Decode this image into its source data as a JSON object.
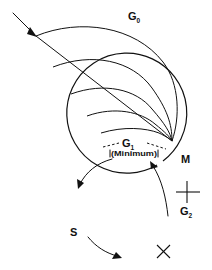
{
  "figure": {
    "background_color": "#ffffff",
    "ink_color": "#111111",
    "width": 212,
    "height": 270
  },
  "labels": {
    "g0": {
      "main": "G",
      "sub": "0"
    },
    "g1": {
      "main": "G",
      "sub": "1",
      "qualifier": "(Minimum)"
    },
    "g2": {
      "main": "G",
      "sub": "2"
    },
    "m": {
      "main": "M"
    },
    "s": {
      "main": "S"
    }
  },
  "cycle": {
    "center_x": 126,
    "center_y": 204,
    "radius": 60,
    "direction": "counter-clockwise",
    "phases": [
      "G1",
      "S",
      "G2",
      "M"
    ],
    "boundary_ticks": 2,
    "direction_arrowheads": 3
  },
  "g0_fan": {
    "arc_count": 5,
    "convergence_x": 172,
    "convergence_y": 141,
    "entry_arrow": "down-right",
    "description": "Nested arcs representing G0 quiescent exit and re-entry"
  },
  "icons": {
    "entry_arrow": "arrow-down-right-icon",
    "cycle_arrow": "arrow-counterclockwise-icon",
    "boundary_tick": "tick-mark-icon"
  }
}
